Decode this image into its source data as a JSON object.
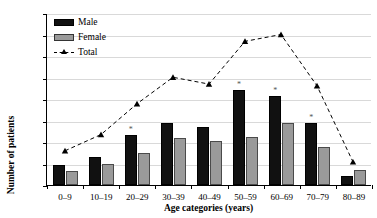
{
  "chart_data": {
    "type": "bar",
    "title": "",
    "xlabel": "Age categories (years)",
    "ylabel": "Number of patients",
    "categories": [
      "0–9",
      "10–19",
      "20–29",
      "30–39",
      "40–49",
      "50–59",
      "60–69",
      "70–79",
      "80–89"
    ],
    "yticks": [
      0,
      25,
      50,
      75,
      100,
      125,
      150,
      175,
      200
    ],
    "ylim": [
      0,
      200
    ],
    "grid": true,
    "legend_position": "top-left",
    "series": [
      {
        "name": "Male",
        "type": "bar",
        "color": "#111111",
        "values": [
          23,
          32,
          58,
          72,
          67,
          111,
          104,
          72,
          11
        ]
      },
      {
        "name": "Female",
        "type": "bar",
        "color": "#9a9a9a",
        "values": [
          16,
          25,
          37,
          55,
          51,
          56,
          72,
          44,
          17
        ]
      },
      {
        "name": "Total",
        "type": "line",
        "color": "#000000",
        "style": "dashed",
        "marker": "triangle",
        "values": [
          40,
          59,
          95,
          126,
          118,
          168,
          176,
          116,
          27
        ]
      }
    ],
    "annotations": [
      {
        "label": "*",
        "category": "20–29",
        "series": "Male"
      },
      {
        "label": "*",
        "category": "50–59",
        "series": "Male"
      },
      {
        "label": "*",
        "category": "60–69",
        "series": "Male"
      },
      {
        "label": "*",
        "category": "70–79",
        "series": "Male"
      }
    ]
  },
  "legend": {
    "items": [
      {
        "label": "Male"
      },
      {
        "label": "Female"
      },
      {
        "label": "Total"
      }
    ]
  },
  "axes": {
    "y_title": "Number of patients",
    "x_title": "Age categories (years)"
  }
}
